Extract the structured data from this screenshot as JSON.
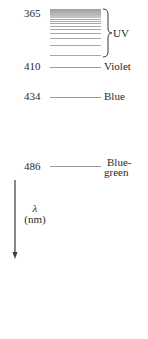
{
  "diagram": {
    "type": "spectral-lines",
    "axis": {
      "symbol": "λ",
      "unit": "(nm)",
      "direction": "down"
    },
    "uv_band": {
      "start_label": "365",
      "region_label": "UV",
      "line_offsets_px": [
        0,
        1,
        2,
        3,
        4,
        5,
        6,
        7,
        9,
        11,
        13,
        16,
        19,
        23,
        28,
        34,
        42
      ]
    },
    "lines": [
      {
        "wavelength": "410",
        "name": "Violet"
      },
      {
        "wavelength": "434",
        "name": "Blue"
      },
      {
        "wavelength": "486",
        "name_line1": "Blue-",
        "name_line2": "green"
      }
    ],
    "colors": {
      "text": "#2a2a2a",
      "line": "#9a9a9a",
      "uv_dense": "#9c9c9c"
    }
  }
}
